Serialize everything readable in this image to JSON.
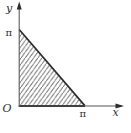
{
  "figure": {
    "labels": {
      "y_axis": "y",
      "x_axis": "x",
      "origin": "O",
      "y_tick": "π",
      "x_tick": "π"
    },
    "geometry": {
      "vertices_math": [
        [
          "0",
          "0"
        ],
        [
          "0",
          "π"
        ],
        [
          "π",
          "0"
        ]
      ],
      "hatch_style": "forward-slash diagonal hatching"
    },
    "colors": {
      "background": "#ffffff",
      "axis": "#555555",
      "edge": "#2c2c2c",
      "hatch": "#606060",
      "text": "#2e2e2e"
    }
  }
}
